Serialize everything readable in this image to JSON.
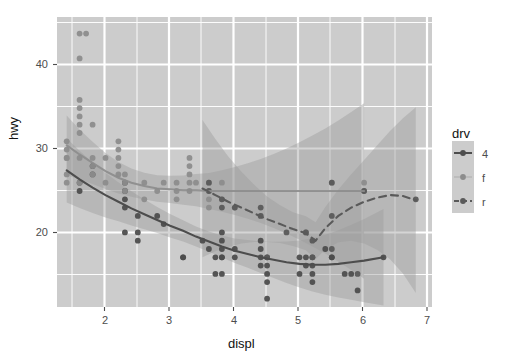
{
  "chart_data": {
    "type": "scatter",
    "title": "",
    "subtitle": "",
    "xlabel": "displ",
    "ylabel": "hwy",
    "xlim": [
      1.45,
      7.25
    ],
    "ylim": [
      11.0,
      46.0
    ],
    "xticks": [
      2,
      3,
      4,
      5,
      6,
      7
    ],
    "yticks": [
      20,
      30,
      40
    ],
    "xtick_labels": [
      "2",
      "3",
      "4",
      "5",
      "6",
      "7"
    ],
    "ytick_labels": [
      "20",
      "30",
      "40"
    ],
    "grid": true,
    "grid_major_color": "#ffffff",
    "grid_minor_color": "#ffffff",
    "panel_background": "#cccccc",
    "legend": {
      "title": "drv",
      "position": "right",
      "entries": [
        {
          "label": "4",
          "color": "#4d4d4d",
          "linetype": "solid"
        },
        {
          "label": "f",
          "color": "#8c8c8c",
          "linetype": "none"
        },
        {
          "label": "r",
          "color": "#5a5a5a",
          "linetype": "dashed"
        }
      ]
    },
    "series": [
      {
        "name": "4",
        "color": "#4d4d4d",
        "linetype": "solid",
        "points": [
          [
            1.8,
            26
          ],
          [
            1.8,
            25
          ],
          [
            2.0,
            28
          ],
          [
            2.0,
            27
          ],
          [
            2.5,
            26
          ],
          [
            2.5,
            25
          ],
          [
            2.5,
            24
          ],
          [
            2.5,
            23
          ],
          [
            2.5,
            20
          ],
          [
            2.7,
            20
          ],
          [
            2.7,
            22
          ],
          [
            2.7,
            19
          ],
          [
            3.0,
            22
          ],
          [
            3.1,
            21
          ],
          [
            3.4,
            17
          ],
          [
            3.4,
            17
          ],
          [
            3.7,
            19
          ],
          [
            3.8,
            18
          ],
          [
            3.9,
            17
          ],
          [
            3.9,
            15
          ],
          [
            4.0,
            20
          ],
          [
            4.0,
            19
          ],
          [
            4.0,
            18
          ],
          [
            4.0,
            17
          ],
          [
            4.0,
            17
          ],
          [
            4.0,
            15
          ],
          [
            4.2,
            18
          ],
          [
            4.2,
            17
          ],
          [
            4.6,
            19
          ],
          [
            4.6,
            18
          ],
          [
            4.6,
            17
          ],
          [
            4.6,
            16
          ],
          [
            4.7,
            17
          ],
          [
            4.7,
            16
          ],
          [
            4.7,
            15
          ],
          [
            4.7,
            14
          ],
          [
            4.7,
            12
          ],
          [
            5.2,
            17
          ],
          [
            5.2,
            15
          ],
          [
            5.3,
            17
          ],
          [
            5.3,
            16
          ],
          [
            5.4,
            17
          ],
          [
            5.4,
            16
          ],
          [
            5.4,
            15
          ],
          [
            5.4,
            14
          ],
          [
            5.6,
            18
          ],
          [
            5.7,
            17
          ],
          [
            5.7,
            17
          ],
          [
            5.9,
            15
          ],
          [
            6.0,
            15
          ],
          [
            6.1,
            13
          ],
          [
            6.5,
            17
          ]
        ],
        "smooth": [
          [
            1.6,
            27.5
          ],
          [
            1.8,
            26.4
          ],
          [
            2.0,
            25.4
          ],
          [
            2.2,
            24.5
          ],
          [
            2.4,
            23.7
          ],
          [
            2.6,
            22.9
          ],
          [
            2.8,
            22.2
          ],
          [
            3.0,
            21.5
          ],
          [
            3.2,
            20.8
          ],
          [
            3.4,
            20.2
          ],
          [
            3.6,
            19.5
          ],
          [
            3.8,
            18.9
          ],
          [
            4.0,
            18.3
          ],
          [
            4.2,
            17.8
          ],
          [
            4.4,
            17.4
          ],
          [
            4.6,
            17.0
          ],
          [
            4.8,
            16.7
          ],
          [
            5.0,
            16.4
          ],
          [
            5.2,
            16.2
          ],
          [
            5.4,
            16.1
          ],
          [
            5.6,
            16.1
          ],
          [
            5.8,
            16.2
          ],
          [
            6.0,
            16.4
          ],
          [
            6.2,
            16.6
          ],
          [
            6.5,
            17.0
          ]
        ]
      },
      {
        "name": "f",
        "color": "#8c8c8c",
        "linetype": "none",
        "points": [
          [
            1.6,
            29
          ],
          [
            1.6,
            29
          ],
          [
            1.6,
            31
          ],
          [
            1.6,
            30
          ],
          [
            1.6,
            26
          ],
          [
            1.6,
            27
          ],
          [
            1.8,
            44
          ],
          [
            1.8,
            41
          ],
          [
            1.8,
            36
          ],
          [
            1.8,
            35
          ],
          [
            1.8,
            34
          ],
          [
            1.8,
            33
          ],
          [
            1.8,
            32
          ],
          [
            1.8,
            29
          ],
          [
            1.8,
            26
          ],
          [
            1.9,
            44
          ],
          [
            2.0,
            33
          ],
          [
            2.0,
            29
          ],
          [
            2.0,
            28
          ],
          [
            2.0,
            27
          ],
          [
            2.2,
            29
          ],
          [
            2.2,
            26
          ],
          [
            2.4,
            31
          ],
          [
            2.4,
            30
          ],
          [
            2.4,
            29
          ],
          [
            2.4,
            28
          ],
          [
            2.4,
            27
          ],
          [
            2.5,
            27
          ],
          [
            2.5,
            26
          ],
          [
            2.5,
            25
          ],
          [
            2.8,
            26
          ],
          [
            2.8,
            24
          ],
          [
            3.0,
            25
          ],
          [
            3.1,
            26
          ],
          [
            3.3,
            26
          ],
          [
            3.3,
            25
          ],
          [
            3.3,
            24
          ],
          [
            3.5,
            29
          ],
          [
            3.5,
            28
          ],
          [
            3.5,
            27
          ],
          [
            3.5,
            26
          ],
          [
            3.5,
            25
          ],
          [
            3.6,
            26
          ],
          [
            3.8,
            26
          ],
          [
            3.8,
            25
          ],
          [
            3.8,
            24
          ],
          [
            3.8,
            23
          ],
          [
            4.0,
            26
          ],
          [
            4.0,
            24
          ],
          [
            4.2,
            23
          ],
          [
            4.6,
            22
          ],
          [
            5.3,
            20
          ],
          [
            5.3,
            20
          ],
          [
            5.7,
            26
          ],
          [
            6.2,
            26
          ],
          [
            6.2,
            25
          ]
        ],
        "smooth": [
          [
            1.6,
            30.5
          ],
          [
            1.8,
            29.4
          ],
          [
            2.0,
            28.4
          ],
          [
            2.2,
            27.4
          ],
          [
            2.4,
            26.6
          ],
          [
            2.6,
            26.0
          ],
          [
            2.8,
            25.6
          ],
          [
            3.0,
            25.3
          ],
          [
            3.2,
            25.2
          ],
          [
            3.4,
            25.1
          ],
          [
            3.6,
            25.1
          ],
          [
            3.8,
            25.0
          ],
          [
            4.0,
            25.0
          ],
          [
            4.2,
            25.0
          ],
          [
            4.4,
            25.0
          ],
          [
            4.6,
            25.0
          ],
          [
            4.8,
            25.0
          ],
          [
            5.0,
            25.0
          ],
          [
            5.2,
            25.0
          ],
          [
            5.4,
            25.0
          ],
          [
            5.6,
            25.0
          ],
          [
            5.8,
            25.0
          ],
          [
            6.0,
            25.0
          ],
          [
            6.2,
            25.0
          ]
        ]
      },
      {
        "name": "r",
        "color": "#5a5a5a",
        "linetype": "dashed",
        "points": [
          [
            3.8,
            26
          ],
          [
            3.8,
            25
          ],
          [
            4.0,
            24
          ],
          [
            4.0,
            23
          ],
          [
            4.2,
            23
          ],
          [
            4.6,
            23
          ],
          [
            4.6,
            22
          ],
          [
            5.0,
            20
          ],
          [
            5.3,
            20
          ],
          [
            5.4,
            19
          ],
          [
            5.7,
            22
          ],
          [
            5.7,
            26
          ],
          [
            6.2,
            25
          ],
          [
            7.0,
            24
          ],
          [
            4.7,
            17
          ],
          [
            5.7,
            18
          ],
          [
            5.4,
            17
          ],
          [
            6.1,
            15
          ]
        ],
        "smooth": [
          [
            3.7,
            25.3
          ],
          [
            3.9,
            24.5
          ],
          [
            4.1,
            23.7
          ],
          [
            4.3,
            23.0
          ],
          [
            4.5,
            22.3
          ],
          [
            4.7,
            21.6
          ],
          [
            4.9,
            21.0
          ],
          [
            5.1,
            20.4
          ],
          [
            5.3,
            19.9
          ],
          [
            5.45,
            19.0
          ],
          [
            5.6,
            20.5
          ],
          [
            5.8,
            22.0
          ],
          [
            6.0,
            23.0
          ],
          [
            6.2,
            23.7
          ],
          [
            6.4,
            24.2
          ],
          [
            6.6,
            24.5
          ],
          [
            6.8,
            24.4
          ],
          [
            7.0,
            23.9
          ]
        ]
      }
    ]
  }
}
